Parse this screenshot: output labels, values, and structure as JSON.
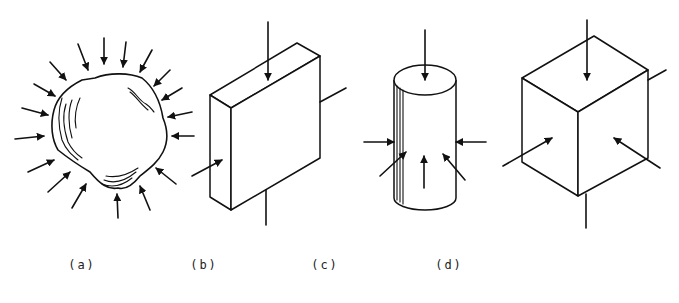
{
  "figure": {
    "panels": [
      {
        "id": "a",
        "label": "(a)",
        "shape": "irregular-rock-specimen",
        "loading": "arrows-all-around"
      },
      {
        "id": "b",
        "label": "(b)",
        "shape": "rectangular-slab",
        "loading": "vertical-and-one-lateral"
      },
      {
        "id": "c",
        "label": "(c)",
        "shape": "cylinder",
        "loading": "axial-and-radial"
      },
      {
        "id": "d",
        "label": "(d)",
        "shape": "cube",
        "loading": "three-orthogonal"
      }
    ],
    "colors": {
      "ink": "#111111",
      "background": "#ffffff"
    }
  }
}
